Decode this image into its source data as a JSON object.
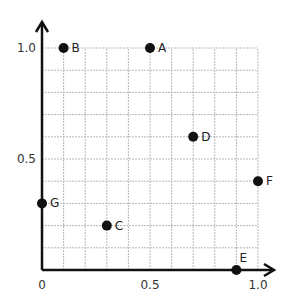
{
  "chart_data": {
    "type": "scatter",
    "title": "",
    "xlabel": "",
    "ylabel": "",
    "xlim": [
      0,
      1.0
    ],
    "ylim": [
      0,
      1.0
    ],
    "grid": true,
    "grid_step": 0.1,
    "x_ticks": [
      "0",
      "0.5",
      "1.0"
    ],
    "y_ticks": [
      "0.5",
      "1.0"
    ],
    "points": [
      {
        "label": "A",
        "x": 0.5,
        "y": 1.0
      },
      {
        "label": "B",
        "x": 0.1,
        "y": 1.0
      },
      {
        "label": "C",
        "x": 0.3,
        "y": 0.2
      },
      {
        "label": "D",
        "x": 0.7,
        "y": 0.6
      },
      {
        "label": "E",
        "x": 0.9,
        "y": 0.0
      },
      {
        "label": "F",
        "x": 1.0,
        "y": 0.4
      },
      {
        "label": "G",
        "x": 0.0,
        "y": 0.3
      }
    ]
  },
  "colors": {
    "axis": "#111111",
    "grid": "#b8b8b8",
    "point": "#111111"
  }
}
